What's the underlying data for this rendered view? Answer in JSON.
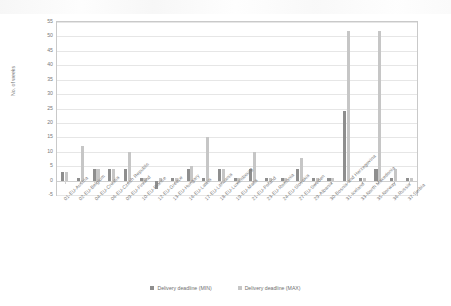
{
  "chart_data": {
    "type": "bar",
    "title": "",
    "xlabel": "",
    "ylabel": "No. of weeks",
    "ylim": [
      -5,
      55
    ],
    "ytick_values": [
      -5,
      0,
      5,
      10,
      15,
      20,
      25,
      30,
      35,
      40,
      45,
      50,
      55
    ],
    "grid": true,
    "legend_position": "bottom",
    "categories": [
      "01-EU-Austria",
      "02-EU-Belgium",
      "04-EU-Croatia",
      "06-EU-Czech Republic",
      "09-EU-Finland",
      "10-EU-France",
      "12-EU-Greece",
      "13-EU-Hungary",
      "16-EU-Latvia",
      "17-EU-Lithuania",
      "18-EU-Luxembourg",
      "19-EU-Malta",
      "21-EU-Poland",
      "23-EU-Romania",
      "24-EU-Slovakia",
      "27-EU-Sweden",
      "29-Albania",
      "30-Bosnia and Herzegovina",
      "31-Iceland",
      "33-North Macedonia",
      "35-Norway",
      "36-Russia",
      "37-Serbia"
    ],
    "series": [
      {
        "name": "Delivery deadline (MIN)",
        "color": "#8e8e8e",
        "values": [
          3,
          1,
          4,
          4,
          4,
          1,
          -3,
          1,
          4,
          1,
          4,
          1,
          4,
          1,
          1,
          4,
          1,
          1,
          24,
          1,
          4,
          1,
          1
        ]
      },
      {
        "name": "Delivery deadline (MAX)",
        "color": "#c6c6c6",
        "values": [
          3,
          12,
          4,
          4,
          10,
          1,
          1,
          1,
          5,
          15,
          4,
          1,
          10,
          1,
          1,
          8,
          1,
          1,
          52,
          1,
          52,
          4,
          1
        ]
      }
    ]
  },
  "axis": {
    "y_label": "No. of weeks"
  },
  "legend": {
    "items": [
      {
        "label": "Delivery deadline (MIN)",
        "swatch": "min-swatch"
      },
      {
        "label": "Delivery deadline (MAX)",
        "swatch": "max-swatch"
      }
    ]
  }
}
